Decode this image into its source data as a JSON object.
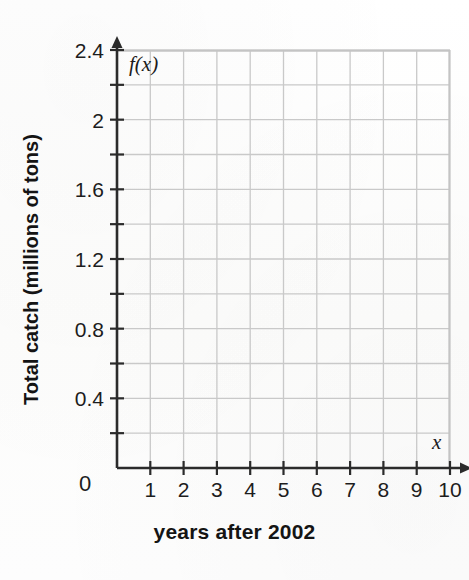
{
  "chart_data": {
    "type": "line",
    "title": "",
    "subtitle": "",
    "xlabel": "years after 2002",
    "ylabel": "Total catch (millions of tons)",
    "x_var_label": "x",
    "y_var_label": "f(x)",
    "origin_label": "0",
    "xlim": [
      0,
      10
    ],
    "ylim": [
      0,
      2.4
    ],
    "x_ticks": [
      1,
      2,
      3,
      4,
      5,
      6,
      7,
      8,
      9,
      10
    ],
    "x_tick_labels": [
      "1",
      "2",
      "3",
      "4",
      "5",
      "6",
      "7",
      "8",
      "9",
      "10"
    ],
    "y_ticks": [
      0.4,
      0.8,
      1.2,
      1.6,
      2.0,
      2.4
    ],
    "y_tick_labels": [
      "0.4",
      "0.8",
      "1.2",
      "1.6",
      "2",
      "2.4"
    ],
    "y_minor_ticks": [
      0.2,
      0.6,
      1.0,
      1.4,
      1.8,
      2.2
    ],
    "grid": true,
    "grid_x_step": 1,
    "grid_y_step": 0.2,
    "legend": false,
    "legend_position": "none",
    "series": [],
    "values": [],
    "categories": [],
    "annotations": [],
    "note": "empty coordinate grid, no data plotted",
    "colors": {
      "background": "#fdfdfd",
      "grid_line": "#c9c9c9",
      "grid_border": "#c4c4c4",
      "axis": "#2b2b2b",
      "text": "#1d1d1d"
    }
  },
  "figure": {
    "y_axis_title": "Total catch (millions of tons)",
    "x_axis_title": "years after 2002",
    "y_var": "f(x)",
    "x_var": "x",
    "origin": "0"
  }
}
